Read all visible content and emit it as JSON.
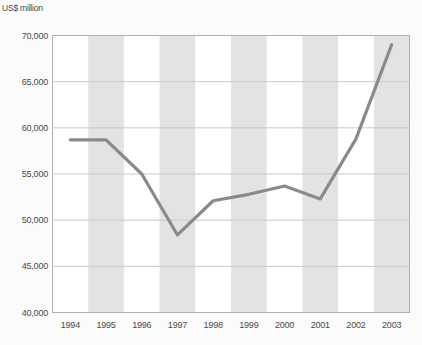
{
  "chart_data": {
    "type": "line",
    "title": "",
    "subtitle": "",
    "ylabel": "US$ million",
    "xlabel": "",
    "categories": [
      "1994",
      "1995",
      "1996",
      "1997",
      "1998",
      "1999",
      "2000",
      "2001",
      "2002",
      "2003"
    ],
    "values": [
      58700,
      58700,
      55000,
      48400,
      52100,
      52800,
      53700,
      52300,
      58800,
      69000
    ],
    "series": [
      {
        "name": "",
        "values": [
          58700,
          58700,
          55000,
          48400,
          52100,
          52800,
          53700,
          52300,
          58800,
          69000
        ]
      }
    ],
    "ylim": [
      40000,
      70000
    ],
    "ytick_labels": [
      "40,000",
      "45,000",
      "50,000",
      "55,000",
      "60,000",
      "65,000",
      "70,000"
    ],
    "ytick_values": [
      40000,
      45000,
      50000,
      55000,
      60000,
      65000,
      70000
    ],
    "grid": "horizontal",
    "legend": "none",
    "banding": "alternating-vertical",
    "colors": {
      "line": "#8a8a8a",
      "band": "#e3e3e3",
      "plot_background": "#ffffff",
      "grid_line": "#c9c9c9",
      "axis_line": "#b0b0b0",
      "text": "#4a4a4a",
      "page_background": "#fbfbfb"
    }
  }
}
